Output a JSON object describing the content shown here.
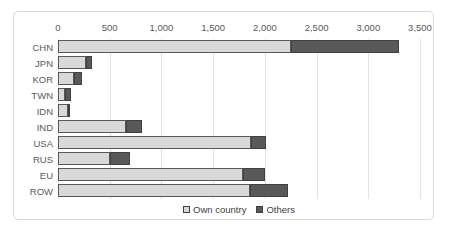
{
  "chart_data": {
    "type": "bar",
    "orientation": "horizontal",
    "stacked": true,
    "title": "",
    "xlabel": "",
    "ylabel": "",
    "categories": [
      "CHN",
      "JPN",
      "KOR",
      "TWN",
      "IDN",
      "IND",
      "USA",
      "RUS",
      "EU",
      "ROW"
    ],
    "series": [
      {
        "name": "Own country",
        "color": "#d9d9d9",
        "border_color": "#595959",
        "values": [
          2250,
          275,
          155,
          65,
          100,
          660,
          1870,
          500,
          1790,
          1855
        ]
      },
      {
        "name": "Others",
        "color": "#595959",
        "border_color": "#404040",
        "values": [
          1050,
          55,
          80,
          60,
          10,
          150,
          145,
          195,
          215,
          370
        ]
      }
    ],
    "x_axis": {
      "position": "top",
      "min": 0,
      "max": 3500,
      "tick_interval": 500,
      "tick_labels": [
        "0",
        "500",
        "1,000",
        "1,500",
        "2,000",
        "2,500",
        "3,000",
        "3,500"
      ]
    },
    "grid": true,
    "gridline_color": "#e2e2e2",
    "legend": {
      "position": "bottom",
      "items": [
        {
          "label": "Own country",
          "color": "#d9d9d9",
          "border_color": "#404040"
        },
        {
          "label": "Others",
          "color": "#595959",
          "border_color": "#404040"
        }
      ]
    }
  },
  "frame": {
    "background": "#ffffff",
    "border_color": "#d9d9d9",
    "text_color": "#595959"
  }
}
